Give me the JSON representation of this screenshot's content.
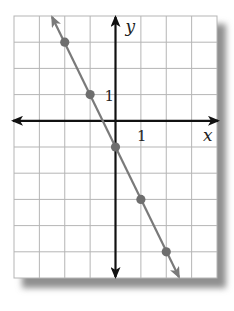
{
  "chart_data": {
    "type": "line",
    "title": "",
    "xlabel": "x",
    "ylabel": "y",
    "xlim": [
      -4,
      4
    ],
    "ylim": [
      -6,
      4
    ],
    "grid": true,
    "tick_labels": {
      "x": "1",
      "y": "1"
    },
    "series": [
      {
        "name": "y = -2x - 1",
        "color": "#7a7a7a",
        "points": [
          [
            -2,
            3
          ],
          [
            -1,
            1
          ],
          [
            0,
            -1
          ],
          [
            1,
            -3
          ],
          [
            2,
            -5
          ]
        ],
        "extends_both_directions": true
      }
    ]
  },
  "colors": {
    "grid": "#b5b5b5",
    "axis": "#111111",
    "line": "#7a7a7a",
    "point": "#6e6e6e",
    "shadow": "#9a9a9a"
  }
}
